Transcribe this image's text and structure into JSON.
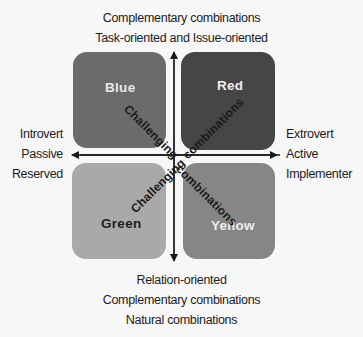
{
  "top_labels": [
    "Complementary combinations",
    "Task-oriented and Issue-oriented"
  ],
  "bottom_labels": [
    "Relation-oriented",
    "Complementary combinations",
    "Natural combinations"
  ],
  "left_labels": [
    "Introvert",
    "Passive",
    "Reserved"
  ],
  "right_labels": [
    "Extrovert",
    "Active",
    "Implementer"
  ],
  "quadrants": {
    "top_left": {
      "label": "Blue",
      "color": "#6b6b6b"
    },
    "top_right": {
      "label": "Red",
      "color": "#464646"
    },
    "bottom_left": {
      "label": "Green",
      "color": "#a9a9a9"
    },
    "bottom_right": {
      "label": "Yellow",
      "color": "#868686"
    }
  },
  "diagonals": {
    "top_left": "Challenging",
    "top_right": "combinations",
    "bottom_left": "Challenging",
    "bottom_right": "combinations"
  },
  "axes": {
    "horizontal": "bidirectional arrow",
    "vertical": "bidirectional arrow"
  }
}
